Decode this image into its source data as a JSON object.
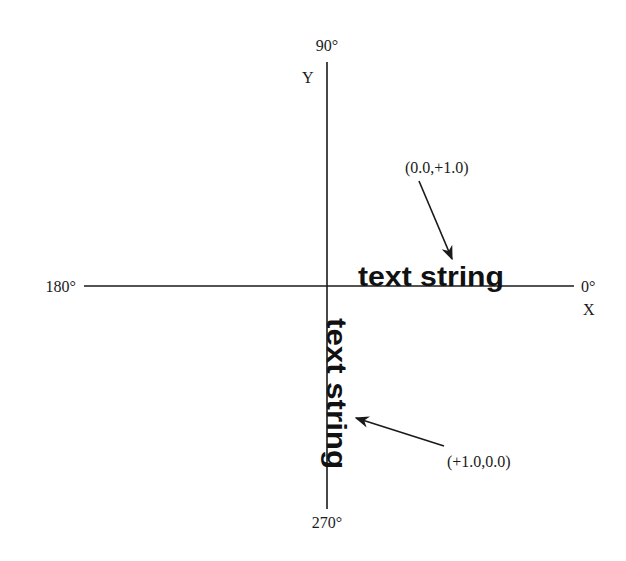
{
  "diagram": {
    "axes": {
      "x_axis_label": "X",
      "y_axis_label": "Y",
      "angle_top": "90°",
      "angle_bottom": "270°",
      "angle_left": "180°",
      "angle_right": "0°"
    },
    "horizontal_text": {
      "text": "text string",
      "direction_vector": "(0.0,+1.0)"
    },
    "vertical_text": {
      "text": "text string",
      "direction_vector": "(+1.0,0.0)"
    },
    "colors": {
      "ink": "#1a1a1a",
      "background": "#ffffff"
    }
  }
}
